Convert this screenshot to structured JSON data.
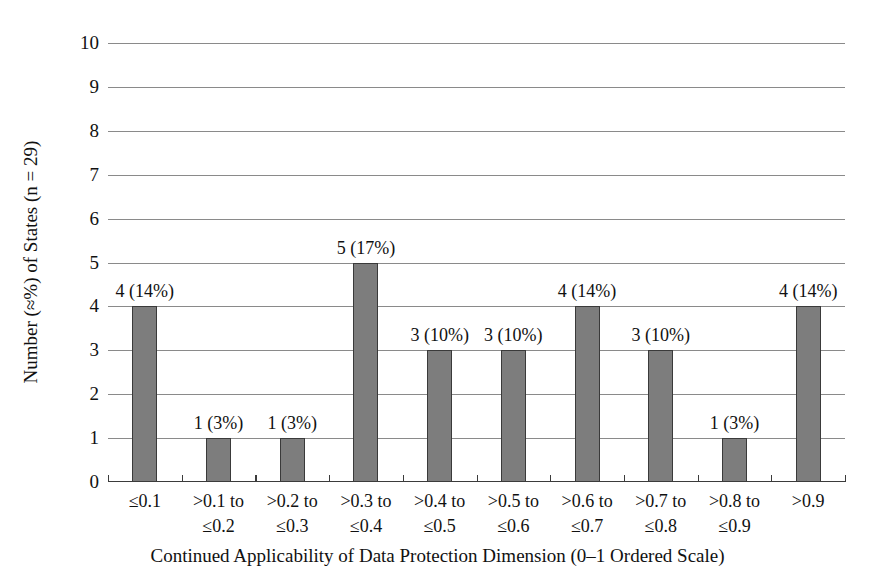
{
  "chart_data": {
    "type": "bar",
    "title": "",
    "xlabel": "Continued Applicability of Data Protection Dimension (0–1 Ordered Scale)",
    "ylabel": "Number (≈%) of States (n = 29)",
    "ylim": [
      0,
      10
    ],
    "ytick_labels": [
      "10",
      "9",
      "8",
      "7",
      "6",
      "5",
      "4",
      "3",
      "2",
      "1",
      "0"
    ],
    "yticks": [
      10,
      9,
      8,
      7,
      6,
      5,
      4,
      3,
      2,
      1,
      0
    ],
    "grid": true,
    "legend": "none",
    "total_n": 29,
    "categories": [
      "≤0.1",
      ">0.1 to ≤0.2",
      ">0.2 to ≤0.3",
      ">0.3 to ≤0.4",
      ">0.4 to ≤0.5",
      ">0.5 to ≤0.6",
      ">0.6 to ≤0.7",
      ">0.7 to ≤0.8",
      ">0.8 to ≤0.9",
      ">0.9"
    ],
    "category_lines": [
      [
        "≤0.1",
        ""
      ],
      [
        ">0.1 to",
        "≤0.2"
      ],
      [
        ">0.2 to",
        "≤0.3"
      ],
      [
        ">0.3 to",
        "≤0.4"
      ],
      [
        ">0.4 to",
        "≤0.5"
      ],
      [
        ">0.5 to",
        "≤0.6"
      ],
      [
        ">0.6 to",
        "≤0.7"
      ],
      [
        ">0.7 to",
        "≤0.8"
      ],
      [
        ">0.8 to",
        "≤0.9"
      ],
      [
        ">0.9",
        ""
      ]
    ],
    "values": [
      4,
      1,
      1,
      5,
      3,
      3,
      4,
      3,
      1,
      4
    ],
    "percentages": [
      14,
      3,
      3,
      17,
      10,
      10,
      14,
      10,
      3,
      14
    ],
    "data_labels": [
      "4 (14%)",
      "1 (3%)",
      "1 (3%)",
      "5 (17%)",
      "3 (10%)",
      "3 (10%)",
      "4 (14%)",
      "3 (10%)",
      "1 (3%)",
      "4 (14%)"
    ],
    "colors": {
      "bar_fill": "#7d7d7d",
      "bar_edge": "#3a3a3a",
      "gridline": "#8a8a8a",
      "axis": "#3b3b3b",
      "background": "#ffffff",
      "text": "#111111"
    }
  }
}
